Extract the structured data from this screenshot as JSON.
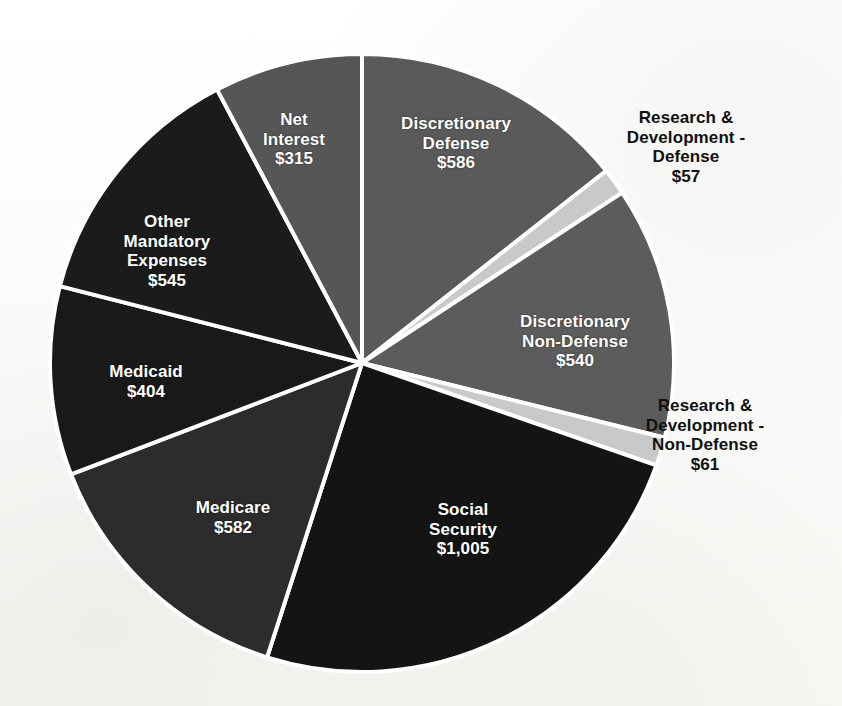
{
  "chart_data": {
    "type": "pie",
    "title": "",
    "subtitle": "",
    "units": "billions of dollars",
    "total": 4095,
    "start_angle_deg": 0,
    "direction": "clockwise",
    "legend": "none",
    "labels_position": "mixed-inside-and-outside",
    "categories": [
      "Discretionary Defense",
      "Research & Development - Defense",
      "Discretionary Non-Defense",
      "Research & Development - Non-Defense",
      "Social Security",
      "Medicare",
      "Medicaid",
      "Other Mandatory Expenses",
      "Net Interest"
    ],
    "values": [
      586,
      57,
      540,
      61,
      1005,
      582,
      404,
      545,
      315
    ],
    "value_labels": [
      "$586",
      "$57",
      "$540",
      "$61",
      "$1,005",
      "$582",
      "$404",
      "$545",
      "$315"
    ],
    "colors": [
      "#5a5a5a",
      "#c9c9c9",
      "#5c5c5c",
      "#c9c9c9",
      "#141414",
      "#2c2c2c",
      "#191919",
      "#1b1b1b",
      "#565656"
    ],
    "slices": [
      {
        "name": "discretionary-defense",
        "label_lines": "Discretionary\nDefense",
        "value_label": "$586",
        "value": 586,
        "color": "#5a5a5a",
        "text_color": "#ffffff",
        "placement": "inside"
      },
      {
        "name": "research-development-defense",
        "label_lines": "Research &\nDevelopment -\nDefense",
        "value_label": "$57",
        "value": 57,
        "color": "#c9c9c9",
        "text_color": "#111111",
        "placement": "outside"
      },
      {
        "name": "discretionary-non-defense",
        "label_lines": "Discretionary\nNon-Defense",
        "value_label": "$540",
        "value": 540,
        "color": "#5c5c5c",
        "text_color": "#ffffff",
        "placement": "inside"
      },
      {
        "name": "research-development-non-defense",
        "label_lines": "Research &\nDevelopment -\nNon-Defense",
        "value_label": "$61",
        "value": 61,
        "color": "#c9c9c9",
        "text_color": "#111111",
        "placement": "outside"
      },
      {
        "name": "social-security",
        "label_lines": "Social\nSecurity",
        "value_label": "$1,005",
        "value": 1005,
        "color": "#141414",
        "text_color": "#ffffff",
        "placement": "inside"
      },
      {
        "name": "medicare",
        "label_lines": "Medicare",
        "value_label": "$582",
        "value": 582,
        "color": "#2c2c2c",
        "text_color": "#ffffff",
        "placement": "inside"
      },
      {
        "name": "medicaid",
        "label_lines": "Medicaid",
        "value_label": "$404",
        "value": 404,
        "color": "#191919",
        "text_color": "#ffffff",
        "placement": "inside"
      },
      {
        "name": "other-mandatory-expenses",
        "label_lines": "Other\nMandatory\nExpenses",
        "value_label": "$545",
        "value": 545,
        "color": "#1b1b1b",
        "text_color": "#ffffff",
        "placement": "inside"
      },
      {
        "name": "net-interest",
        "label_lines": "Net\nInterest",
        "value_label": "$315",
        "value": 315,
        "color": "#565656",
        "text_color": "#ffffff",
        "placement": "inside"
      }
    ],
    "geometry": {
      "center_x": 362,
      "center_y": 363,
      "radius_x": 312,
      "radius_y": 309,
      "separator_color": "#ffffff",
      "separator_width": 4
    }
  },
  "labels": {
    "discretionary_defense": "Discretionary\nDefense\n$586",
    "research_development_defense": "Research &\nDevelopment -\nDefense\n$57",
    "discretionary_non_defense": "Discretionary\nNon-Defense\n$540",
    "research_development_non_defense": "Research &\nDevelopment -\nNon-Defense\n$61",
    "social_security": "Social\nSecurity\n$1,005",
    "medicare": "Medicare\n$582",
    "medicaid": "Medicaid\n$404",
    "other_mandatory_expenses": "Other\nMandatory\nExpenses\n$545",
    "net_interest": "Net\nInterest\n$315"
  }
}
